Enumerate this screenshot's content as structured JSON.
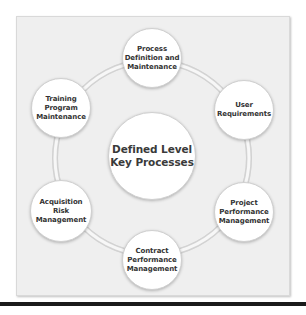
{
  "diagram": {
    "center": {
      "label_line1": "Defined Level",
      "label_line2": "Key Processes"
    },
    "nodes": [
      {
        "lines": [
          "Process",
          "Definition and",
          "Maintenance"
        ]
      },
      {
        "lines": [
          "User",
          "Requirements"
        ]
      },
      {
        "lines": [
          "Project",
          "Performance",
          "Management"
        ]
      },
      {
        "lines": [
          "Contract",
          "Performance",
          "Management"
        ]
      },
      {
        "lines": [
          "Acquisition Risk",
          "Management"
        ]
      },
      {
        "lines": [
          "Training",
          "Program",
          "Maintenance"
        ]
      }
    ],
    "colors": {
      "background": "#efefef",
      "node_fill": "#ffffff",
      "text": "#333333",
      "ring": "#dcdcdc",
      "bottom_bar": "#1a1a1a"
    }
  }
}
